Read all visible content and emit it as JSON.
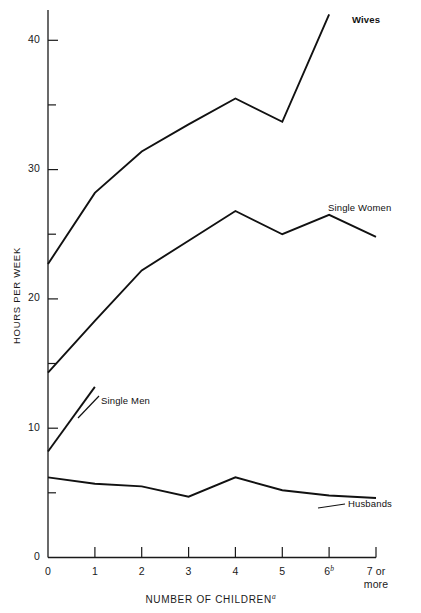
{
  "chart_data": {
    "type": "line",
    "title": "",
    "xlabel": "NUMBER OF CHILDREN",
    "xlabel_superscript": "a",
    "ylabel": "HOURS PER WEEK",
    "categories": [
      "0",
      "1",
      "2",
      "3",
      "4",
      "5",
      "6",
      "7 or more"
    ],
    "x_tick_labels": [
      {
        "text": "0",
        "sup": ""
      },
      {
        "text": "1",
        "sup": ""
      },
      {
        "text": "2",
        "sup": ""
      },
      {
        "text": "3",
        "sup": ""
      },
      {
        "text": "4",
        "sup": ""
      },
      {
        "text": "5",
        "sup": ""
      },
      {
        "text": "6",
        "sup": "b"
      },
      {
        "text": "7 or",
        "sup": "",
        "second_line": "more"
      }
    ],
    "y_tick_labels": [
      "0",
      "10",
      "20",
      "30",
      "40"
    ],
    "y_major_ticks": [
      0,
      10,
      20,
      30,
      40
    ],
    "y_minor_ticks": [
      5,
      15,
      25,
      35
    ],
    "ylim": [
      0,
      43
    ],
    "xlim": [
      0,
      7
    ],
    "grid": false,
    "legend_position": "inline-annotations",
    "line_color": "#111111",
    "series": [
      {
        "name": "Wives",
        "label": "Wives",
        "label_bold": true,
        "x": [
          0,
          1,
          2,
          3,
          4,
          5,
          6
        ],
        "values": [
          22.7,
          28.2,
          31.4,
          33.5,
          35.5,
          33.7,
          42.0
        ]
      },
      {
        "name": "Single Women",
        "label": "Single Women",
        "label_bold": false,
        "x": [
          0,
          1,
          2,
          3,
          4,
          5,
          6,
          7
        ],
        "values": [
          14.3,
          18.3,
          22.2,
          24.5,
          26.8,
          25.0,
          26.5,
          24.8
        ]
      },
      {
        "name": "Single Men",
        "label": "Single Men",
        "label_bold": false,
        "x": [
          0,
          1
        ],
        "values": [
          8.2,
          13.2
        ]
      },
      {
        "name": "Husbands",
        "label": "Husbands",
        "label_bold": false,
        "x": [
          0,
          1,
          2,
          3,
          4,
          5,
          6,
          7
        ],
        "values": [
          6.2,
          5.7,
          5.5,
          4.7,
          6.2,
          5.2,
          4.8,
          4.6
        ]
      }
    ]
  },
  "annotations": {
    "wives": "Wives",
    "single_women": "Single Women",
    "single_men": "Single Men",
    "husbands": "Husbands"
  },
  "axes": {
    "y_title": "HOURS PER WEEK",
    "x_title": "NUMBER OF CHILDREN",
    "x_title_sup": "a"
  }
}
